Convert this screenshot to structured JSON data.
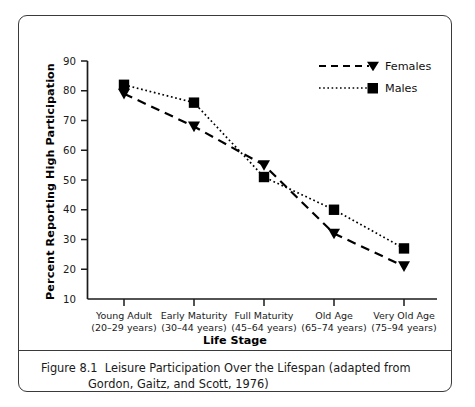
{
  "figure": {
    "caption_line1": "Figure 8.1  Leisure Participation Over the Lifespan (adapted from",
    "caption_line2": "Gordon, Gaitz, and Scott, 1976)"
  },
  "chart_data": {
    "type": "line",
    "title": "",
    "xlabel": "Life Stage",
    "ylabel": "Percent Reporting High Participation",
    "categories": [
      "Young Adult\n(20–29 years)",
      "Early Maturity\n(30–44 years)",
      "Full Maturity\n(45–64 years)",
      "Old Age\n(65–74 years)",
      "Very Old Age\n(75–94 years)"
    ],
    "category_lines": [
      [
        "Young Adult",
        "(20–29 years)"
      ],
      [
        "Early Maturity",
        "(30–44 years)"
      ],
      [
        "Full Maturity",
        "(45–64 years)"
      ],
      [
        "Old Age",
        "(65–74 years)"
      ],
      [
        "Very Old Age",
        "(75–94 years)"
      ]
    ],
    "series": [
      {
        "name": "Females",
        "values": [
          79,
          68,
          55,
          32,
          21
        ],
        "marker": "triangle-down",
        "linestyle": "dashed",
        "color": "#000000"
      },
      {
        "name": "Males",
        "values": [
          82,
          76,
          51,
          40,
          27
        ],
        "marker": "square",
        "linestyle": "dotted",
        "color": "#000000"
      }
    ],
    "yticks": [
      10,
      20,
      30,
      40,
      50,
      60,
      70,
      80,
      90
    ],
    "ytick_labels": [
      "10",
      "20",
      "30",
      "40",
      "50",
      "60",
      "70",
      "80",
      "90"
    ],
    "ylim": [
      10,
      90
    ],
    "grid": false,
    "legend_position": "top-right",
    "legend": [
      "Females",
      "Males"
    ]
  }
}
